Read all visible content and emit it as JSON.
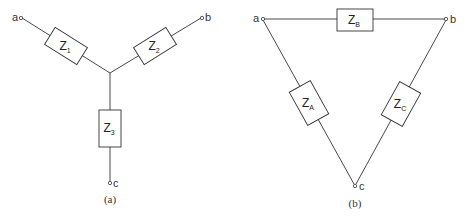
{
  "star": {
    "caption": "(a)",
    "terminals": {
      "a": "a",
      "b": "b",
      "c": "c"
    },
    "impedances": [
      {
        "main": "Z",
        "sub": "1"
      },
      {
        "main": "Z",
        "sub": "2"
      },
      {
        "main": "Z",
        "sub": "3"
      }
    ]
  },
  "delta": {
    "caption": "(b)",
    "terminals": {
      "a": "a",
      "b": "b",
      "c": "c"
    },
    "impedances": [
      {
        "main": "Z",
        "sub": "B"
      },
      {
        "main": "Z",
        "sub": "A"
      },
      {
        "main": "Z",
        "sub": "C"
      }
    ]
  },
  "colors": {
    "line": "#333333",
    "background": "#ffffff"
  }
}
